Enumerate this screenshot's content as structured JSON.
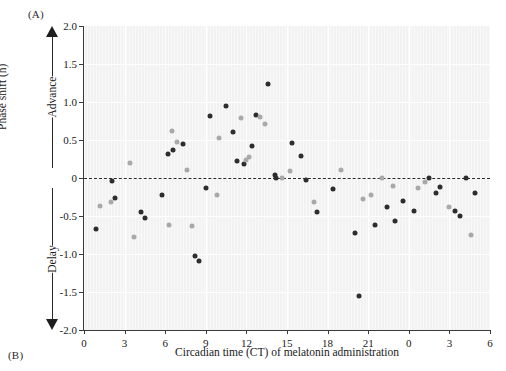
{
  "figure": {
    "panel_a_label": "(A)",
    "panel_b_label": "(B)"
  },
  "chart_data": {
    "type": "scatter",
    "title": "",
    "xlabel": "Circadian time (CT) of melatonin administration",
    "ylabel": "Phase shift (h)",
    "xlim": [
      0,
      30
    ],
    "ylim": [
      -2.0,
      2.0
    ],
    "grid": true,
    "legend_position": "none",
    "x_tick_values": [
      0,
      3,
      6,
      9,
      12,
      15,
      18,
      21,
      24,
      27,
      30
    ],
    "x_tick_labels": [
      "0",
      "3",
      "6",
      "9",
      "12",
      "15",
      "18",
      "21",
      "0",
      "3",
      "6"
    ],
    "y_tick_values": [
      2.0,
      1.5,
      1.0,
      0.5,
      0,
      -0.5,
      -1.0,
      -1.5,
      -2.0
    ],
    "y_tick_labels": [
      "2.0",
      "1.5",
      "1.0",
      "0.5",
      "0",
      "-0.5",
      "-1.0",
      "-1.5",
      "-2.0"
    ],
    "reference_line": {
      "y": 0,
      "style": "dashed"
    },
    "direction_labels": {
      "up": "Advance",
      "down": "Delay"
    },
    "colors": {
      "dark_series": "#2d2d2d",
      "light_series": "#a9a9a9",
      "plot_background": "#f2f2f2",
      "gridline": "#ffffff",
      "axis": "#3a3a3a"
    },
    "series": [
      {
        "name": "dark",
        "points": [
          [
            0.9,
            -0.67
          ],
          [
            2.1,
            -0.04
          ],
          [
            2.3,
            -0.26
          ],
          [
            4.2,
            -0.45
          ],
          [
            4.5,
            -0.53
          ],
          [
            5.8,
            -0.23
          ],
          [
            6.2,
            0.31
          ],
          [
            6.6,
            0.37
          ],
          [
            7.3,
            0.45
          ],
          [
            8.2,
            -1.02
          ],
          [
            8.5,
            -1.09
          ],
          [
            9.0,
            -0.13
          ],
          [
            9.3,
            0.81
          ],
          [
            10.5,
            0.95
          ],
          [
            11.0,
            0.6
          ],
          [
            11.3,
            0.22
          ],
          [
            11.8,
            0.18
          ],
          [
            12.4,
            0.42
          ],
          [
            12.7,
            0.83
          ],
          [
            13.6,
            1.24
          ],
          [
            14.1,
            0.04
          ],
          [
            14.2,
            0.0
          ],
          [
            15.4,
            0.46
          ],
          [
            16.0,
            0.29
          ],
          [
            16.4,
            -0.02
          ],
          [
            17.2,
            -0.45
          ],
          [
            18.4,
            -0.15
          ],
          [
            20.0,
            -0.73
          ],
          [
            20.3,
            -1.55
          ],
          [
            21.5,
            -0.62
          ],
          [
            22.4,
            -0.38
          ],
          [
            23.0,
            -0.57
          ],
          [
            23.6,
            -0.3
          ],
          [
            24.4,
            -0.44
          ],
          [
            25.5,
            0.0
          ],
          [
            26.0,
            -0.2
          ],
          [
            26.3,
            -0.12
          ],
          [
            27.4,
            -0.43
          ],
          [
            27.8,
            -0.5
          ],
          [
            28.2,
            0.0
          ],
          [
            28.9,
            -0.2
          ]
        ]
      },
      {
        "name": "light",
        "points": [
          [
            1.2,
            -0.37
          ],
          [
            2.0,
            -0.31
          ],
          [
            3.4,
            0.2
          ],
          [
            3.7,
            -0.78
          ],
          [
            6.3,
            -0.62
          ],
          [
            6.5,
            0.62
          ],
          [
            6.9,
            0.48
          ],
          [
            7.6,
            0.11
          ],
          [
            8.0,
            -0.63
          ],
          [
            9.8,
            -0.23
          ],
          [
            10.0,
            0.53
          ],
          [
            11.6,
            0.79
          ],
          [
            12.0,
            0.24
          ],
          [
            12.2,
            0.27
          ],
          [
            13.0,
            0.8
          ],
          [
            13.4,
            0.71
          ],
          [
            14.6,
            0.0
          ],
          [
            15.2,
            0.09
          ],
          [
            17.0,
            -0.31
          ],
          [
            19.0,
            0.11
          ],
          [
            20.6,
            -0.27
          ],
          [
            21.2,
            -0.22
          ],
          [
            22.0,
            0.0
          ],
          [
            22.8,
            -0.1
          ],
          [
            24.7,
            -0.13
          ],
          [
            25.2,
            -0.05
          ],
          [
            27.0,
            -0.38
          ],
          [
            28.6,
            -0.75
          ]
        ]
      }
    ]
  }
}
